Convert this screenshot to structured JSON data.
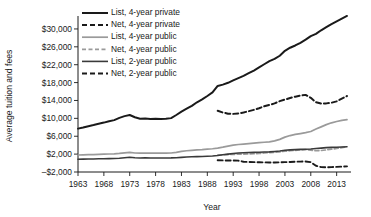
{
  "chart_data": {
    "type": "line",
    "title": "",
    "xlabel": "Year",
    "ylabel": "Average tuition and fees",
    "xlim": [
      1963,
      2015
    ],
    "ylim": [
      -2000,
      32000
    ],
    "ytick_labels": [
      "$30,000",
      "$26,000",
      "$22,000",
      "$18,000",
      "$14,000",
      "$10,000",
      "$6,000",
      "$2,000",
      "–$2,000"
    ],
    "ytick_values": [
      30000,
      26000,
      22000,
      18000,
      14000,
      10000,
      6000,
      2000,
      -2000
    ],
    "xtick_labels": [
      "1963",
      "1968",
      "1973",
      "1978",
      "1983",
      "1988",
      "1993",
      "1998",
      "2003",
      "2008",
      "2013"
    ],
    "xtick_values": [
      1963,
      1968,
      1973,
      1978,
      1983,
      1988,
      1993,
      1998,
      2003,
      2008,
      2013
    ],
    "grid": false,
    "legend_position": "top-left-inside",
    "series": [
      {
        "name": "List, 4-year private",
        "color": "#1a1a1a",
        "width": 2.0,
        "dash": "none",
        "x": [
          1963,
          1964,
          1965,
          1966,
          1967,
          1968,
          1969,
          1970,
          1971,
          1972,
          1973,
          1974,
          1975,
          1976,
          1977,
          1978,
          1979,
          1980,
          1981,
          1982,
          1983,
          1984,
          1985,
          1986,
          1987,
          1988,
          1989,
          1990,
          1991,
          1992,
          1993,
          1994,
          1995,
          1996,
          1997,
          1998,
          1999,
          2000,
          2001,
          2002,
          2003,
          2004,
          2005,
          2006,
          2007,
          2008,
          2009,
          2010,
          2011,
          2012,
          2013,
          2014,
          2015
        ],
        "y": [
          7700,
          7950,
          8250,
          8500,
          8800,
          9050,
          9350,
          9600,
          10100,
          10500,
          10750,
          10250,
          9900,
          9950,
          9850,
          9900,
          9850,
          9900,
          10050,
          10750,
          11500,
          12150,
          12800,
          13600,
          14250,
          15000,
          15800,
          17250,
          17550,
          17950,
          18500,
          19000,
          19500,
          20100,
          20700,
          21400,
          22100,
          22800,
          23300,
          24000,
          25100,
          25800,
          26300,
          26900,
          27600,
          28400,
          28900,
          29700,
          30400,
          31100,
          31700,
          32300,
          32900
        ]
      },
      {
        "name": "Net, 4-year private",
        "color": "#1a1a1a",
        "width": 2.0,
        "dash": "5,3",
        "x": [
          1990,
          1991,
          1992,
          1993,
          1994,
          1995,
          1996,
          1997,
          1998,
          1999,
          2000,
          2001,
          2002,
          2003,
          2004,
          2005,
          2006,
          2007,
          2008,
          2009,
          2010,
          2011,
          2012,
          2013,
          2014,
          2015
        ],
        "y": [
          11700,
          11300,
          11050,
          11000,
          11100,
          11300,
          11600,
          11900,
          12250,
          12700,
          13000,
          13350,
          13850,
          14200,
          14550,
          14850,
          15100,
          15250,
          14600,
          13600,
          13300,
          13350,
          13500,
          13800,
          14400,
          15000
        ]
      },
      {
        "name": "List, 4-year public",
        "color": "#9a9a9a",
        "width": 1.7,
        "dash": "none",
        "x": [
          1963,
          1964,
          1965,
          1966,
          1967,
          1968,
          1969,
          1970,
          1971,
          1972,
          1973,
          1974,
          1975,
          1976,
          1977,
          1978,
          1979,
          1980,
          1981,
          1982,
          1983,
          1984,
          1985,
          1986,
          1987,
          1988,
          1989,
          1990,
          1991,
          1992,
          1993,
          1994,
          1995,
          1996,
          1997,
          1998,
          1999,
          2000,
          2001,
          2002,
          2003,
          2004,
          2005,
          2006,
          2007,
          2008,
          2009,
          2010,
          2011,
          2012,
          2013,
          2014,
          2015
        ],
        "y": [
          1800,
          1830,
          1870,
          1900,
          1950,
          1990,
          2030,
          2070,
          2150,
          2280,
          2400,
          2250,
          2200,
          2230,
          2200,
          2220,
          2200,
          2210,
          2250,
          2400,
          2600,
          2750,
          2850,
          2950,
          3000,
          3100,
          3200,
          3350,
          3550,
          3800,
          4000,
          4150,
          4250,
          4350,
          4450,
          4550,
          4650,
          4750,
          4950,
          5300,
          5800,
          6150,
          6400,
          6600,
          6800,
          7050,
          7600,
          8100,
          8600,
          9000,
          9300,
          9550,
          9700
        ]
      },
      {
        "name": "Net, 4-year public",
        "color": "#9a9a9a",
        "width": 1.7,
        "dash": "4,2.5",
        "x": [
          1990,
          1991,
          1992,
          1993,
          1994,
          1995,
          1996,
          1997,
          1998,
          1999,
          2000,
          2001,
          2002,
          2003,
          2004,
          2005,
          2006,
          2007,
          2008,
          2009,
          2010,
          2011,
          2012,
          2013,
          2014,
          2015
        ],
        "y": [
          1800,
          1850,
          1900,
          1950,
          2000,
          2020,
          2050,
          2080,
          2150,
          2250,
          2350,
          2400,
          2500,
          2650,
          2750,
          2850,
          2950,
          3000,
          2900,
          2750,
          2800,
          2950,
          3100,
          3250,
          3450,
          3650
        ]
      },
      {
        "name": "List, 2-year public",
        "color": "#3a3a3a",
        "width": 1.6,
        "dash": "none",
        "x": [
          1963,
          1964,
          1965,
          1966,
          1967,
          1968,
          1969,
          1970,
          1971,
          1972,
          1973,
          1974,
          1975,
          1976,
          1977,
          1978,
          1979,
          1980,
          1981,
          1982,
          1983,
          1984,
          1985,
          1986,
          1987,
          1988,
          1989,
          1990,
          1991,
          1992,
          1993,
          1994,
          1995,
          1996,
          1997,
          1998,
          1999,
          2000,
          2001,
          2002,
          2003,
          2004,
          2005,
          2006,
          2007,
          2008,
          2009,
          2010,
          2011,
          2012,
          2013,
          2014,
          2015
        ],
        "y": [
          850,
          870,
          900,
          920,
          950,
          970,
          1000,
          1030,
          1080,
          1180,
          1300,
          1180,
          1120,
          1150,
          1120,
          1130,
          1120,
          1130,
          1150,
          1200,
          1280,
          1350,
          1400,
          1450,
          1480,
          1520,
          1580,
          1700,
          1850,
          2000,
          2150,
          2250,
          2300,
          2350,
          2400,
          2430,
          2470,
          2500,
          2600,
          2700,
          2850,
          2950,
          3000,
          3050,
          3100,
          3150,
          3250,
          3350,
          3450,
          3500,
          3550,
          3600,
          3650
        ]
      },
      {
        "name": "Net, 2-year public",
        "color": "#1a1a1a",
        "width": 1.9,
        "dash": "5,3",
        "x": [
          1990,
          1991,
          1992,
          1993,
          1994,
          1995,
          1996,
          1997,
          1998,
          1999,
          2000,
          2001,
          2002,
          2003,
          2004,
          2005,
          2006,
          2007,
          2008,
          2009,
          2010,
          2011,
          2012,
          2013,
          2014,
          2015
        ],
        "y": [
          620,
          600,
          580,
          560,
          540,
          300,
          250,
          200,
          180,
          150,
          120,
          130,
          160,
          200,
          250,
          300,
          330,
          350,
          200,
          -600,
          -900,
          -950,
          -900,
          -850,
          -800,
          -750
        ]
      }
    ]
  },
  "legend": {
    "items": [
      {
        "label": "List, 4-year private"
      },
      {
        "label": "Net, 4-year private"
      },
      {
        "label": "List, 4-year public"
      },
      {
        "label": "Net, 4-year public"
      },
      {
        "label": "List, 2-year public"
      },
      {
        "label": "Net, 2-year public"
      }
    ]
  }
}
